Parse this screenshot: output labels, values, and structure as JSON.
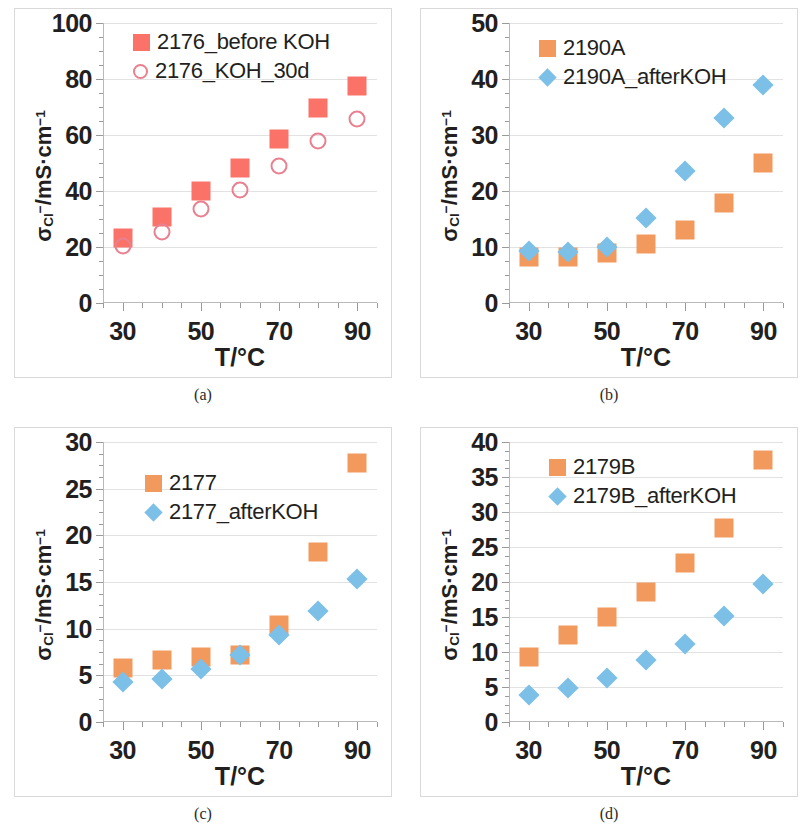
{
  "figure": {
    "panel_count": 4,
    "colors": {
      "red_square": "#fa7268",
      "pink_circle_stroke": "#e9808f",
      "orange_square": "#f2995e",
      "blue_diamond": "#7cc0e8",
      "gridline": "#e2e2e2",
      "frame": "#d9d9d9",
      "text": "#231f20"
    },
    "common": {
      "xlabel": "T/°C",
      "ylabel_html": "σ<sub>Cl</sub><sup>−</sup>/mS·cm<sup>−1</sup>",
      "x_ticks": [
        30,
        50,
        70,
        90
      ],
      "x_range": [
        25,
        95
      ],
      "x_minor_step": 5
    }
  },
  "chart_data": [
    {
      "type": "scatter",
      "panel": "a",
      "caption": "(a)",
      "title": "",
      "xlabel": "T/°C",
      "ylabel": "σCl−/mS·cm−1",
      "xlim": [
        25,
        95
      ],
      "ylim": [
        0,
        100
      ],
      "y_ticks": [
        0,
        20,
        40,
        60,
        80,
        100
      ],
      "y_minor_step": 5,
      "grid": true,
      "legend_position": "top-left-inside",
      "x": [
        30,
        40,
        50,
        60,
        70,
        80,
        90
      ],
      "series": [
        {
          "name": "2176_before KOH",
          "marker": "square",
          "color": "#fa7268",
          "filled": true,
          "values": [
            23.2,
            30.8,
            40.0,
            48.2,
            58.5,
            69.8,
            77.5
          ]
        },
        {
          "name": "2176_KOH_30d",
          "marker": "circle",
          "color": "#e9808f",
          "filled": false,
          "values": [
            20.5,
            25.5,
            33.5,
            40.3,
            48.8,
            57.8,
            65.8
          ]
        }
      ]
    },
    {
      "type": "scatter",
      "panel": "b",
      "caption": "(b)",
      "title": "",
      "xlabel": "T/°C",
      "ylabel": "σCl−/mS·cm−1",
      "xlim": [
        25,
        95
      ],
      "ylim": [
        0,
        50
      ],
      "y_ticks": [
        0,
        10,
        20,
        30,
        40,
        50
      ],
      "y_minor_step": 2.5,
      "grid": true,
      "legend_position": "top-left-inside",
      "x": [
        30,
        40,
        50,
        60,
        70,
        80,
        90
      ],
      "series": [
        {
          "name": "2190A",
          "marker": "square",
          "color": "#f2995e",
          "filled": true,
          "values": [
            8.2,
            8.3,
            9.0,
            10.5,
            13.0,
            17.8,
            25.0
          ]
        },
        {
          "name": "2190A_afterKOH",
          "marker": "diamond",
          "color": "#7cc0e8",
          "filled": true,
          "values": [
            9.2,
            9.1,
            10.0,
            15.2,
            23.6,
            33.0,
            39.0
          ]
        }
      ]
    },
    {
      "type": "scatter",
      "panel": "c",
      "caption": "(c)",
      "title": "",
      "xlabel": "T/°C",
      "ylabel": "σCl−/mS·cm−1",
      "xlim": [
        25,
        95
      ],
      "ylim": [
        0,
        30
      ],
      "y_ticks": [
        0,
        5,
        10,
        15,
        20,
        25,
        30
      ],
      "y_minor_step": 1.25,
      "grid": true,
      "legend_position": "top-left-inside",
      "x": [
        30,
        40,
        50,
        60,
        70,
        80,
        90
      ],
      "series": [
        {
          "name": "2177",
          "marker": "square",
          "color": "#f2995e",
          "filled": true,
          "values": [
            5.8,
            6.6,
            7.0,
            7.2,
            10.4,
            18.2,
            27.8
          ]
        },
        {
          "name": "2177_afterKOH",
          "marker": "diamond",
          "color": "#7cc0e8",
          "filled": true,
          "values": [
            4.3,
            4.6,
            5.7,
            7.2,
            9.3,
            11.9,
            15.3
          ]
        }
      ]
    },
    {
      "type": "scatter",
      "panel": "d",
      "caption": "(d)",
      "title": "",
      "xlabel": "T/°C",
      "ylabel": "σCl−/mS·cm−1",
      "xlim": [
        25,
        95
      ],
      "ylim": [
        0,
        40
      ],
      "y_ticks": [
        0,
        5,
        10,
        15,
        20,
        25,
        30,
        35,
        40
      ],
      "y_minor_step": 1.25,
      "grid": true,
      "legend_position": "top-left-inside",
      "x": [
        30,
        40,
        50,
        60,
        70,
        80,
        90
      ],
      "series": [
        {
          "name": "2179B",
          "marker": "square",
          "color": "#f2995e",
          "filled": true,
          "values": [
            9.3,
            12.5,
            15.0,
            18.6,
            22.7,
            27.7,
            37.5
          ]
        },
        {
          "name": "2179B_afterKOH",
          "marker": "diamond",
          "color": "#7cc0e8",
          "filled": true,
          "values": [
            3.8,
            4.9,
            6.3,
            8.8,
            11.2,
            15.1,
            19.7
          ]
        }
      ]
    }
  ],
  "legends": {
    "a": [
      {
        "label": "2176_before KOH",
        "marker": "square",
        "color": "#fa7268",
        "filled": true
      },
      {
        "label": "2176_KOH_30d",
        "marker": "circle",
        "color": "#e9808f",
        "filled": false
      }
    ],
    "b": [
      {
        "label": "2190A",
        "marker": "square",
        "color": "#f2995e",
        "filled": true
      },
      {
        "label": "2190A_afterKOH",
        "marker": "diamond",
        "color": "#7cc0e8",
        "filled": true
      }
    ],
    "c": [
      {
        "label": "2177",
        "marker": "square",
        "color": "#f2995e",
        "filled": true
      },
      {
        "label": "2177_afterKOH",
        "marker": "diamond",
        "color": "#7cc0e8",
        "filled": true
      }
    ],
    "d": [
      {
        "label": "2179B",
        "marker": "square",
        "color": "#f2995e",
        "filled": true
      },
      {
        "label": "2179B_afterKOH",
        "marker": "diamond",
        "color": "#7cc0e8",
        "filled": true
      }
    ]
  }
}
